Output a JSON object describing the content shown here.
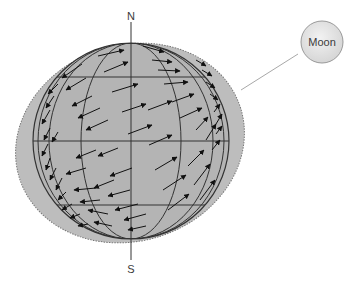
{
  "figure": {
    "labels": {
      "north": "N",
      "south": "S",
      "moon": "Moon"
    },
    "colors": {
      "background": "#ffffff",
      "bulge_fill": "#bdbdbd",
      "globe_fill": "#b4b4b4",
      "grid_line": "#333333",
      "arrow": "#111111",
      "moon_fill": "#e6e6e6",
      "moon_stroke": "#9a9a9a",
      "connector": "#a8a8a8"
    },
    "elements": [
      "tidal-bulge-ellipse",
      "earth-globe",
      "latitude-lines",
      "longitude-lines",
      "rotation-axis",
      "tidal-force-arrows",
      "moon",
      "moon-connector-line"
    ]
  }
}
